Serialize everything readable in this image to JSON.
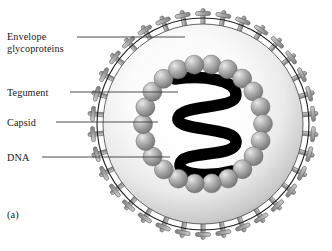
{
  "figure": {
    "panel_label": "(a)",
    "diagram_name": "herpesvirus-virion-structure",
    "labels": [
      {
        "id": "envelope",
        "text": "Envelope\nglycoproteins",
        "target": "envelope-spike"
      },
      {
        "id": "tegument",
        "text": "Tegument",
        "target": "tegument-layer"
      },
      {
        "id": "capsid",
        "text": "Capsid",
        "target": "capsid-sphere"
      },
      {
        "id": "dna",
        "text": "DNA",
        "target": "dna-strand"
      }
    ],
    "structure": {
      "envelope": {
        "name": "lipid-envelope",
        "center_x": 203,
        "center_y": 124,
        "outer_radius": 106,
        "inner_radius": 100,
        "spike_count": 34,
        "spike_length": 17,
        "stroke": "#231f20"
      },
      "tegument": {
        "name": "tegument-layer",
        "radius": 100,
        "fill_center": "#fdfdfd",
        "fill_edge": "#9b9b9b"
      },
      "capsid": {
        "name": "capsid-shell",
        "sphere_count": 22,
        "ring_radius": 60,
        "sphere_radius": 9.5,
        "fill": "#8a8a8a",
        "highlight": "#e3e3e3"
      },
      "dna": {
        "name": "dna-strand",
        "color": "#000000",
        "stroke_width": 11,
        "loops": 3
      }
    },
    "colors": {
      "background": "#ffffff",
      "outline": "#231f20",
      "spike": "#a6a6a6",
      "spike_outline": "#6e6e6e",
      "leader_line": "#3a3a3a",
      "text": "#191919"
    }
  }
}
